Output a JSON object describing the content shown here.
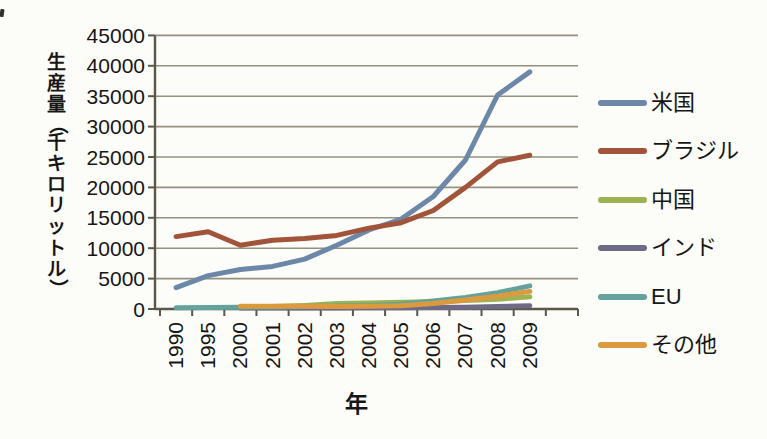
{
  "page": {
    "background": "#fcfcf8"
  },
  "chart_data": {
    "type": "line",
    "title": "",
    "xlabel": "年",
    "ylabel": "生産量（千キロリットル）",
    "ylim": [
      0,
      45000
    ],
    "y_ticks": [
      0,
      5000,
      10000,
      15000,
      20000,
      25000,
      30000,
      35000,
      40000,
      45000
    ],
    "categories": [
      "1990",
      "1995",
      "2000",
      "2001",
      "2002",
      "2003",
      "2004",
      "2005",
      "2006",
      "2007",
      "2008",
      "2009"
    ],
    "grid": true,
    "legend_position": "right",
    "series": [
      {
        "name": "米国",
        "color": "#6d87a8",
        "values": [
          3500,
          5500,
          6500,
          7000,
          8200,
          10500,
          13000,
          14800,
          18500,
          24500,
          35200,
          39000
        ]
      },
      {
        "name": "ブラジル",
        "color": "#a2543a",
        "values": [
          11900,
          12700,
          10500,
          11300,
          11600,
          12100,
          13300,
          14200,
          16200,
          20000,
          24200,
          25300
        ]
      },
      {
        "name": "中国",
        "color": "#9cb354",
        "values": [
          null,
          null,
          300,
          400,
          600,
          900,
          1000,
          1100,
          1200,
          1400,
          1600,
          2000
        ]
      },
      {
        "name": "インド",
        "color": "#6f6a85",
        "values": [
          null,
          null,
          150,
          150,
          150,
          150,
          200,
          200,
          250,
          300,
          400,
          550
        ]
      },
      {
        "name": "EU",
        "color": "#63a39b",
        "values": [
          200,
          250,
          300,
          350,
          400,
          500,
          600,
          800,
          1300,
          1900,
          2700,
          3800
        ]
      },
      {
        "name": "その他",
        "color": "#dc9a3f",
        "values": [
          null,
          null,
          450,
          450,
          450,
          400,
          450,
          550,
          900,
          1500,
          2100,
          2900
        ]
      }
    ],
    "colors": {
      "gridline": "#8f8d79",
      "axis": "#5a5849",
      "text": "#161616"
    }
  }
}
